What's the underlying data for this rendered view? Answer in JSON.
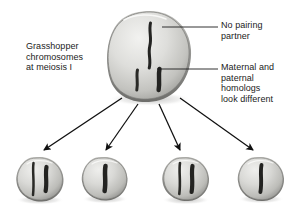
{
  "figure": {
    "kind": "micrograph-diagram",
    "background_color": "#ffffff",
    "text_color": "#1b1b1b",
    "line_color": "#1b1b1b"
  },
  "labels": {
    "left": "Grasshopper\nchromosomes\nat meiosis I",
    "top_right": "No pairing\npartner",
    "bottom_right": "Maternal and\npaternal\nhomologs\nlook different"
  },
  "parent_cell": {
    "name": "meiosis-I-cell",
    "shape": "rounded-oval",
    "fill_light": "#e9e9e7",
    "fill_mid": "#c9c9c6",
    "fill_dark": "#8f8f8c",
    "chromosomes": [
      {
        "id": "unpaired-x",
        "role": "no pairing partner",
        "length": "long",
        "thickness": "thin"
      },
      {
        "id": "maternal-homolog",
        "role": "maternal homolog",
        "length": "short",
        "thickness": "thin"
      },
      {
        "id": "paternal-homolog",
        "role": "paternal homolog",
        "length": "short",
        "thickness": "thick"
      }
    ]
  },
  "daughter_cells": [
    {
      "id": "cell-1",
      "chromosome_count": 2,
      "chromosomes": [
        "thin-long",
        "thick-short"
      ]
    },
    {
      "id": "cell-2",
      "chromosome_count": 1,
      "chromosomes": [
        "thick-short"
      ]
    },
    {
      "id": "cell-3",
      "chromosome_count": 2,
      "chromosomes": [
        "thin-long",
        "thick-short"
      ]
    },
    {
      "id": "cell-4",
      "chromosome_count": 1,
      "chromosomes": [
        "thick-medium"
      ]
    }
  ],
  "arrows": {
    "count": 4,
    "from": "parent-cell-bottom",
    "to": "daughter-cells",
    "style": "solid-black-filled-head"
  },
  "leader_lines": [
    {
      "id": "leader-no-pairing-partner",
      "points_to": "unpaired-x"
    },
    {
      "id": "leader-homologs",
      "points_to": "homolog-pair"
    }
  ]
}
